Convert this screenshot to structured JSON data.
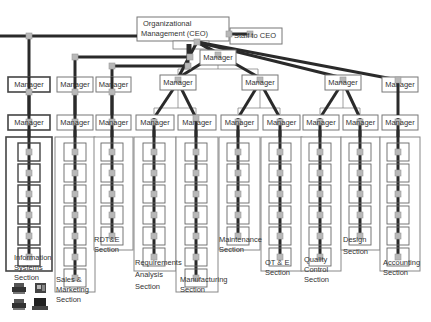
{
  "colors": {
    "line_dark": "#2a2a2a",
    "box_border": "#777777",
    "box_border_dark": "#444444",
    "node": "#b8b8b8",
    "text": "#333333"
  },
  "ceo": {
    "label_line1": "Organizational",
    "label_line2": "Management (CEO)"
  },
  "staff": {
    "label": "Staff to CEO"
  },
  "manager_label": "Manager",
  "sections": [
    {
      "id": "information-systems",
      "label": [
        "Information",
        "Systems",
        "Section"
      ],
      "units": 6
    },
    {
      "id": "sales-marketing",
      "label": [
        "Sales &",
        "Marketing",
        "Section"
      ],
      "units": 7
    },
    {
      "id": "rdte",
      "label": [
        "RDT&E",
        "Section"
      ],
      "units": 5
    },
    {
      "id": "requirements-analysis",
      "label": [
        "Requirements",
        "Analysis",
        "Section"
      ],
      "units": 6
    },
    {
      "id": "manufacturing",
      "label": [
        "Manufacturing",
        "Section"
      ],
      "units": 7
    },
    {
      "id": "maintenance",
      "label": [
        "Maintenance",
        "Section"
      ],
      "units": 5
    },
    {
      "id": "ot-e",
      "label": [
        "OT & E",
        "Section"
      ],
      "units": 6
    },
    {
      "id": "quality-control",
      "label": [
        "Quality",
        "Control",
        "Section"
      ],
      "units": 6
    },
    {
      "id": "design",
      "label": [
        "Design",
        "Section"
      ],
      "units": 5
    },
    {
      "id": "accounting",
      "label": [
        "Accounting",
        "Section"
      ],
      "units": 6
    }
  ],
  "icons": [
    "printer-icon",
    "fax-icon",
    "printer-icon",
    "computer-icon"
  ]
}
